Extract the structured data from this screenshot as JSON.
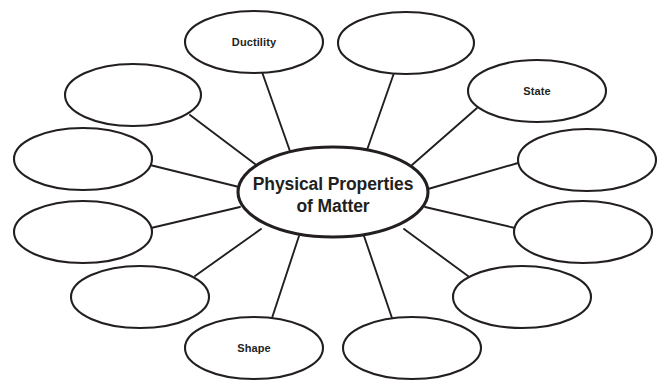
{
  "diagram": {
    "type": "bubble-map",
    "title": "Physical Properties of Matter",
    "center": {
      "label_line1": "Physical Properties",
      "label_line2": "of Matter",
      "cx": 333,
      "cy": 192,
      "rx": 95,
      "ry": 45
    },
    "stroke_color": "#231f20",
    "fill_color": "#ffffff",
    "background_color": "#ffffff",
    "node_count": 12,
    "filled_node_count": 3,
    "blank_node_count": 9,
    "nodes": [
      {
        "id": "node-1",
        "label": "Ductility",
        "cx": 254,
        "cy": 42,
        "rx": 69,
        "ry": 31,
        "blank": false
      },
      {
        "id": "node-2",
        "label": "",
        "cx": 406,
        "cy": 43,
        "rx": 68,
        "ry": 31,
        "blank": true
      },
      {
        "id": "node-3",
        "label": "State",
        "cx": 537,
        "cy": 91,
        "rx": 69,
        "ry": 31,
        "blank": false
      },
      {
        "id": "node-4",
        "label": "",
        "cx": 587,
        "cy": 160,
        "rx": 69,
        "ry": 31,
        "blank": true
      },
      {
        "id": "node-5",
        "label": "",
        "cx": 583,
        "cy": 232,
        "rx": 69,
        "ry": 31,
        "blank": true
      },
      {
        "id": "node-6",
        "label": "",
        "cx": 522,
        "cy": 297,
        "rx": 69,
        "ry": 31,
        "blank": true
      },
      {
        "id": "node-7",
        "label": "",
        "cx": 412,
        "cy": 348,
        "rx": 69,
        "ry": 31,
        "blank": true
      },
      {
        "id": "node-8",
        "label": "Shape",
        "cx": 254,
        "cy": 348,
        "rx": 69,
        "ry": 31,
        "blank": false
      },
      {
        "id": "node-9",
        "label": "",
        "cx": 140,
        "cy": 297,
        "rx": 69,
        "ry": 31,
        "blank": true
      },
      {
        "id": "node-10",
        "label": "",
        "cx": 83,
        "cy": 232,
        "rx": 69,
        "ry": 31,
        "blank": true
      },
      {
        "id": "node-11",
        "label": "",
        "cx": 83,
        "cy": 159,
        "rx": 69,
        "ry": 31,
        "blank": true
      },
      {
        "id": "node-12",
        "label": "",
        "cx": 133,
        "cy": 95,
        "rx": 68,
        "ry": 31,
        "blank": true
      }
    ],
    "connectors": [
      {
        "id": "connector-1",
        "from": "center",
        "to": "node-1",
        "x1": 291,
        "y1": 154,
        "x2": 262,
        "y2": 72
      },
      {
        "id": "connector-2",
        "from": "center",
        "to": "node-2",
        "x1": 367,
        "y1": 150,
        "x2": 394,
        "y2": 73
      },
      {
        "id": "connector-3",
        "from": "center",
        "to": "node-3",
        "x1": 412,
        "y1": 165,
        "x2": 477,
        "y2": 108
      },
      {
        "id": "connector-4",
        "from": "center",
        "to": "node-4",
        "x1": 428,
        "y1": 189,
        "x2": 518,
        "y2": 163
      },
      {
        "id": "connector-5",
        "from": "center",
        "to": "node-5",
        "x1": 425,
        "y1": 207,
        "x2": 515,
        "y2": 228
      },
      {
        "id": "connector-6",
        "from": "center",
        "to": "node-6",
        "x1": 404,
        "y1": 229,
        "x2": 468,
        "y2": 276
      },
      {
        "id": "connector-7",
        "from": "center",
        "to": "node-7",
        "x1": 364,
        "y1": 236,
        "x2": 392,
        "y2": 318
      },
      {
        "id": "connector-8",
        "from": "center",
        "to": "node-8",
        "x1": 299,
        "y1": 236,
        "x2": 272,
        "y2": 318
      },
      {
        "id": "connector-9",
        "from": "center",
        "to": "node-9",
        "x1": 261,
        "y1": 229,
        "x2": 195,
        "y2": 276
      },
      {
        "id": "connector-10",
        "from": "center",
        "to": "node-10",
        "x1": 240,
        "y1": 207,
        "x2": 151,
        "y2": 228
      },
      {
        "id": "connector-11",
        "from": "center",
        "to": "node-11",
        "x1": 239,
        "y1": 187,
        "x2": 150,
        "y2": 165
      },
      {
        "id": "connector-12",
        "from": "center",
        "to": "node-12",
        "x1": 255,
        "y1": 164,
        "x2": 190,
        "y2": 115
      }
    ]
  }
}
